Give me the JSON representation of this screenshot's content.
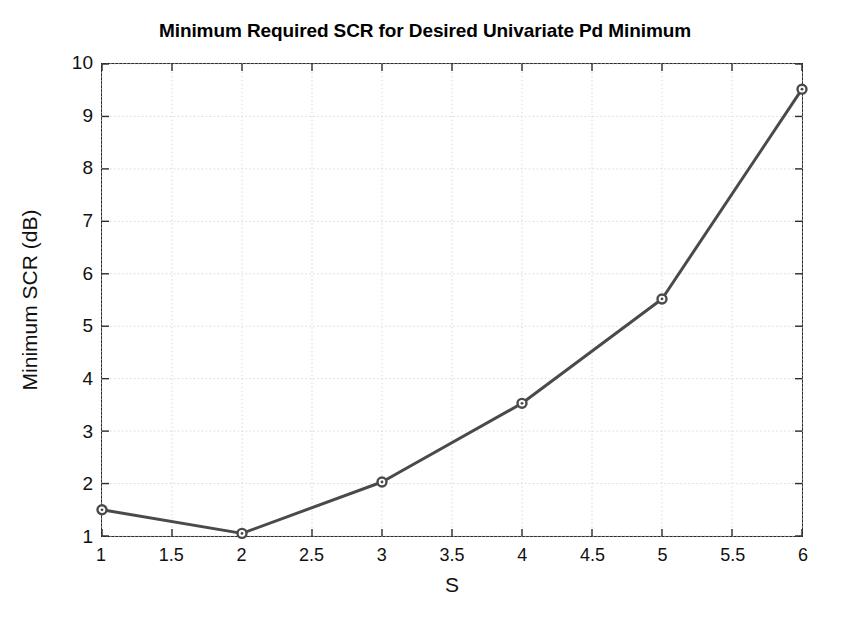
{
  "chart_data": {
    "type": "line",
    "title": "Minimum Required SCR for Desired Univariate Pd Minimum",
    "xlabel": "S",
    "ylabel": "Minimum SCR (dB)",
    "x": [
      1,
      2,
      3,
      4,
      5,
      6
    ],
    "values": [
      1.5,
      1.05,
      2.03,
      3.53,
      5.52,
      9.52
    ],
    "series": [
      {
        "name": "Minimum SCR",
        "x": [
          1,
          2,
          3,
          4,
          5,
          6
        ],
        "values": [
          1.5,
          1.05,
          2.03,
          3.53,
          5.52,
          9.52
        ]
      }
    ],
    "xlim": [
      1,
      6
    ],
    "ylim": [
      1,
      10
    ],
    "xticks": [
      1,
      1.5,
      2,
      2.5,
      3,
      3.5,
      4,
      4.5,
      5,
      5.5,
      6
    ],
    "xtick_labels": [
      "1",
      "1.5",
      "2",
      "2.5",
      "3",
      "3.5",
      "4",
      "4.5",
      "5",
      "5.5",
      "6"
    ],
    "yticks": [
      1,
      2,
      3,
      4,
      5,
      6,
      7,
      8,
      9,
      10
    ],
    "ytick_labels": [
      "1",
      "2",
      "3",
      "4",
      "5",
      "6",
      "7",
      "8",
      "9",
      "10"
    ],
    "grid": true,
    "grid_style": "dotted",
    "legend": null,
    "marker": "circle-open",
    "line_color": "#4a4a4a",
    "marker_color": "#4a4a4a",
    "grid_color": "#d9d9d9",
    "axis_color": "#2b2b2b",
    "background": "#ffffff",
    "line_width": 3,
    "marker_size": 9
  }
}
